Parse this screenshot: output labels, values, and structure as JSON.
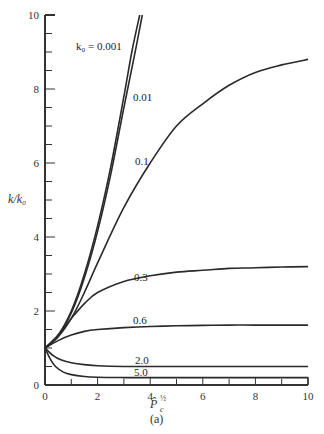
{
  "chart_data": {
    "type": "line",
    "title": "",
    "caption": "(a)",
    "xlabel": "P̂c^½",
    "ylabel": "k/k₀",
    "xlim": [
      0,
      10
    ],
    "ylim": [
      0,
      10
    ],
    "xticks": [
      0,
      2,
      4,
      6,
      8,
      10
    ],
    "yticks": [
      0,
      2,
      4,
      6,
      8,
      10
    ],
    "grid": false,
    "legend": "inline curve labels",
    "series": [
      {
        "name": "k₀ = 0.001",
        "label": "k₀ = 0.001",
        "x": [
          0,
          0.5,
          1,
          1.5,
          2,
          2.5,
          3,
          3.3,
          3.6
        ],
        "y": [
          1,
          1.35,
          2.0,
          3.0,
          4.3,
          5.9,
          7.8,
          9.0,
          10
        ]
      },
      {
        "name": "0.01",
        "label": "0.01",
        "x": [
          0,
          0.5,
          1,
          1.5,
          2,
          2.5,
          3,
          3.4,
          3.7
        ],
        "y": [
          1,
          1.33,
          1.95,
          2.9,
          4.15,
          5.7,
          7.5,
          8.9,
          10
        ]
      },
      {
        "name": "0.1",
        "label": "0.1",
        "x": [
          0,
          0.5,
          1,
          1.5,
          2,
          3,
          4,
          5,
          6,
          7,
          8,
          9,
          10
        ],
        "y": [
          1,
          1.3,
          1.8,
          2.5,
          3.3,
          4.8,
          6.0,
          7.0,
          7.6,
          8.1,
          8.45,
          8.65,
          8.8
        ]
      },
      {
        "name": "0.3",
        "label": "0.3",
        "x": [
          0,
          0.5,
          1,
          1.5,
          2,
          3,
          4,
          5,
          6,
          7,
          8,
          9,
          10
        ],
        "y": [
          1,
          1.35,
          1.8,
          2.2,
          2.5,
          2.8,
          2.95,
          3.05,
          3.1,
          3.15,
          3.17,
          3.19,
          3.2
        ]
      },
      {
        "name": "0.6",
        "label": "0.6",
        "x": [
          0,
          0.5,
          1,
          1.5,
          2,
          3,
          4,
          5,
          6,
          7,
          8,
          10
        ],
        "y": [
          1,
          1.2,
          1.35,
          1.45,
          1.5,
          1.55,
          1.58,
          1.6,
          1.61,
          1.62,
          1.62,
          1.62
        ]
      },
      {
        "name": "2.0",
        "label": "2.0",
        "x": [
          0,
          0.3,
          0.6,
          1,
          1.5,
          2,
          3,
          4,
          6,
          8,
          10
        ],
        "y": [
          1,
          0.8,
          0.68,
          0.6,
          0.55,
          0.52,
          0.5,
          0.5,
          0.5,
          0.5,
          0.5
        ]
      },
      {
        "name": "5.0",
        "label": "5.0",
        "x": [
          0,
          0.2,
          0.4,
          0.7,
          1,
          1.5,
          2,
          3,
          4,
          6,
          8,
          10
        ],
        "y": [
          1,
          0.7,
          0.5,
          0.35,
          0.28,
          0.23,
          0.21,
          0.2,
          0.2,
          0.2,
          0.2,
          0.2
        ]
      }
    ]
  },
  "labels": {
    "k001": "k₀ = 0.001",
    "k01": "0.01",
    "k1": "0.1",
    "k3": "0.3",
    "k6": "0.6",
    "k20": "2.0",
    "k50": "5.0",
    "ylabel": "k/k₀",
    "xlabel_main": "P̂",
    "xlabel_sub": "c",
    "xlabel_sup": "½",
    "caption": "(a)"
  }
}
